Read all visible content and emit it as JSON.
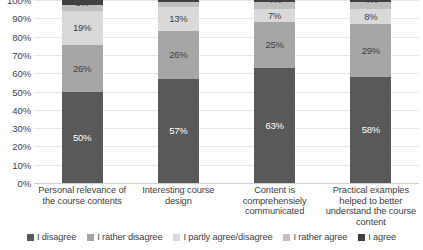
{
  "chart_data": {
    "type": "bar",
    "stacked": true,
    "orientation": "vertical",
    "title": "",
    "xlabel": "",
    "ylabel": "",
    "ylim": [
      0,
      100
    ],
    "ytick_labels": [
      "100%",
      "90%",
      "80%",
      "70%",
      "60%",
      "50%",
      "40%",
      "30%",
      "20%",
      "10%",
      "0%"
    ],
    "ytick_values": [
      100,
      90,
      80,
      70,
      60,
      50,
      40,
      30,
      20,
      10,
      0
    ],
    "grid": true,
    "legend_position": "bottom",
    "value_suffix": "%",
    "categories": [
      "Personal relevance of the course contents",
      "Interesting course design",
      "Content is comprehensiely communicated",
      "Practical examples helped to better understand the course content"
    ],
    "series": [
      {
        "name": "I disagree",
        "color": "#595959",
        "values": [
          50,
          57,
          63,
          58
        ]
      },
      {
        "name": "I rather disagree",
        "color": "#a6a6a6",
        "values": [
          26,
          26,
          25,
          29
        ]
      },
      {
        "name": "I partly agree/disagree",
        "color": "#d9d9d9",
        "values": [
          19,
          13,
          7,
          8
        ]
      },
      {
        "name": "I rather agree",
        "color": "#bfbfbf",
        "values": [
          3,
          3,
          4,
          4
        ]
      },
      {
        "name": "I agree",
        "color": "#404040",
        "values": [
          3,
          1,
          1,
          1
        ]
      }
    ],
    "bar_labels": [
      [
        "50%",
        "26%",
        "19%",
        "3%",
        "3%"
      ],
      [
        "57%",
        "26%",
        "13%",
        "3%",
        "1%"
      ],
      [
        "63%",
        "25%",
        "7%",
        "4%",
        "1%"
      ],
      [
        "58%",
        "29%",
        "8%",
        "4%",
        "1%"
      ]
    ]
  }
}
